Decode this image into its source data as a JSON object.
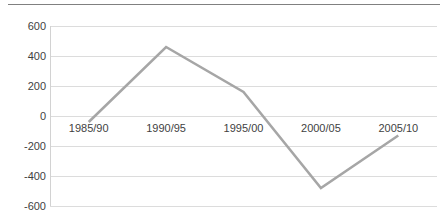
{
  "chart_data": {
    "type": "line",
    "title": "",
    "subtitle": "",
    "xlabel": "",
    "ylabel": "",
    "categories": [
      "1985/90",
      "1990/95",
      "1995/00",
      "2000/05",
      "2005/10"
    ],
    "series": [
      {
        "name": "Series 1",
        "color": "#a6a6a6",
        "values": [
          -40,
          460,
          160,
          -480,
          -130
        ]
      }
    ],
    "ylim": [
      -600,
      600
    ],
    "yticks": [
      600,
      400,
      200,
      0,
      -200,
      -400,
      -600
    ],
    "ytick_labels": [
      "600",
      "400",
      "200",
      "0",
      "-200",
      "-400",
      "-600"
    ],
    "grid": true,
    "grid_axis": "y",
    "grid_color": "#dcdcdc",
    "legend": false,
    "legend_position": "none",
    "markers": false,
    "line_width": 2.5,
    "axis_line_color": "#808080",
    "tick_label_color": "#3f3f3f",
    "background_color": "#ffffff"
  },
  "figure": {
    "top_rule_color": "#808080"
  }
}
